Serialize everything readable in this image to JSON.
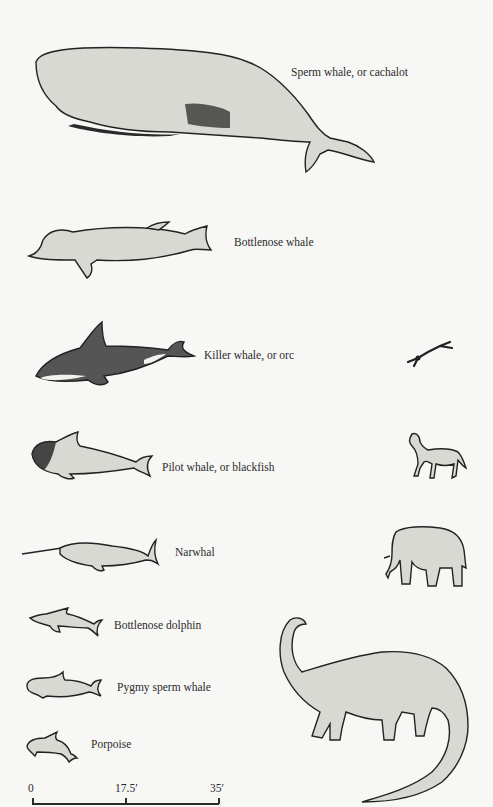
{
  "whales": [
    {
      "id": "sperm-whale",
      "label": "Sperm whale, or cachalot"
    },
    {
      "id": "bottlenose-whale",
      "label": "Bottlenose whale"
    },
    {
      "id": "killer-whale",
      "label": "Killer whale, or orc"
    },
    {
      "id": "pilot-whale",
      "label": "Pilot whale, or blackfish"
    },
    {
      "id": "narwhal",
      "label": "Narwhal"
    },
    {
      "id": "bottlenose-dolphin",
      "label": "Bottlenose dolphin"
    },
    {
      "id": "pygmy-sperm-whale",
      "label": "Pygmy sperm whale"
    },
    {
      "id": "porpoise",
      "label": "Porpoise"
    }
  ],
  "comparison_figures": [
    {
      "id": "human-diver",
      "label": "Human (swimmer)"
    },
    {
      "id": "horse",
      "label": "Horse"
    },
    {
      "id": "elephant",
      "label": "Elephant"
    },
    {
      "id": "brontosaurus",
      "label": "Sauropod dinosaur"
    }
  ],
  "scale_bar": {
    "ticks": [
      "0",
      "17.5′",
      "35′"
    ],
    "unit": "feet",
    "max": 35
  }
}
